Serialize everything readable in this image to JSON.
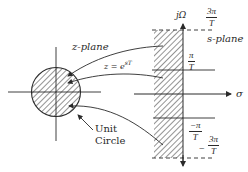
{
  "figure": {
    "z_plane": {
      "label": "z-plane",
      "mapping_label": "z = e",
      "mapping_exponent": "sT",
      "unit_circle_label_line1": "Unit",
      "unit_circle_label_line2": "Circle"
    },
    "s_plane": {
      "label": "s-plane",
      "vertical_axis_label": "jΩ",
      "horizontal_axis_label": "σ",
      "ticks": [
        {
          "sign": "",
          "numerator": "3π",
          "denominator": "T",
          "style": "dashed"
        },
        {
          "sign": "",
          "numerator": "π",
          "denominator": "T",
          "style": "solid"
        },
        {
          "sign": "−",
          "numerator": "π",
          "denominator": "T",
          "style": "solid"
        },
        {
          "sign": "−",
          "numerator": "3π",
          "denominator": "T",
          "style": "dashed"
        }
      ]
    },
    "colors": {
      "ink": "#2a2a2a",
      "background": "#ffffff"
    }
  }
}
